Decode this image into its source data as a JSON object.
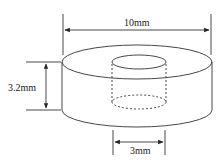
{
  "diagram": {
    "dimensions": {
      "outer_diameter": "10mm",
      "height": "3.2mm",
      "hole_diameter": "3mm"
    },
    "colors": {
      "line": "#333333",
      "background": "#ffffff"
    }
  }
}
